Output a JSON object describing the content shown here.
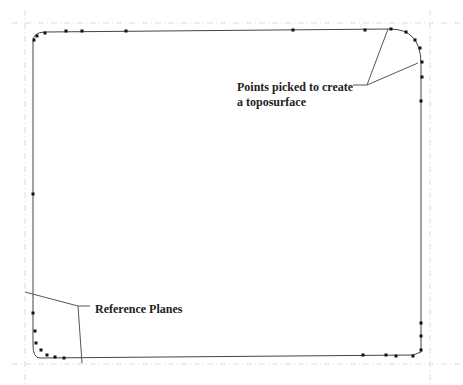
{
  "annotations": {
    "points_label_line1": "Points picked to create",
    "points_label_line2": "a toposurface",
    "reference_planes_label": "Reference Planes"
  },
  "colors": {
    "outline": "#444444",
    "points": "#111111",
    "leader": "#555555",
    "ref_plane": "#dcdcdc"
  },
  "outline_path": "M33,70 L33,42 Q33,32 45,32 L390,29 Q420,29 421,62 L421,352 L413,355 L40,358 Q33,358 33,345 Z",
  "picked_points": [
    [
      34,
      40
    ],
    [
      37,
      36
    ],
    [
      45,
      33
    ],
    [
      66,
      31
    ],
    [
      82,
      31
    ],
    [
      126,
      31
    ],
    [
      293,
      30
    ],
    [
      365,
      30
    ],
    [
      391,
      29
    ],
    [
      406,
      32
    ],
    [
      415,
      40
    ],
    [
      420,
      48
    ],
    [
      422,
      62
    ],
    [
      422,
      77
    ],
    [
      421,
      101
    ],
    [
      33,
      194
    ],
    [
      33,
      313
    ],
    [
      35,
      331
    ],
    [
      36,
      343
    ],
    [
      41,
      350
    ],
    [
      47,
      355
    ],
    [
      55,
      357
    ],
    [
      64,
      358
    ],
    [
      363,
      355
    ],
    [
      386,
      355
    ],
    [
      396,
      356
    ],
    [
      413,
      356
    ],
    [
      421,
      350
    ],
    [
      421,
      336
    ],
    [
      421,
      323
    ]
  ],
  "leader_lines": [
    {
      "x1": 388,
      "y1": 29,
      "x2": 367,
      "y2": 85
    },
    {
      "x1": 418,
      "y1": 63,
      "x2": 367,
      "y2": 85
    },
    {
      "x1": 367,
      "y1": 85,
      "x2": 353,
      "y2": 85
    },
    {
      "x1": 25,
      "y1": 292,
      "x2": 78,
      "y2": 306
    },
    {
      "x1": 78,
      "y1": 306,
      "x2": 82,
      "y2": 363
    },
    {
      "x1": 78,
      "y1": 306,
      "x2": 90,
      "y2": 306
    }
  ],
  "reference_planes": [
    {
      "x1": 12,
      "y1": 23,
      "x2": 463,
      "y2": 23
    },
    {
      "x1": 25,
      "y1": 10,
      "x2": 25,
      "y2": 385
    },
    {
      "x1": 12,
      "y1": 364,
      "x2": 463,
      "y2": 364
    },
    {
      "x1": 430,
      "y1": 10,
      "x2": 430,
      "y2": 385
    }
  ]
}
